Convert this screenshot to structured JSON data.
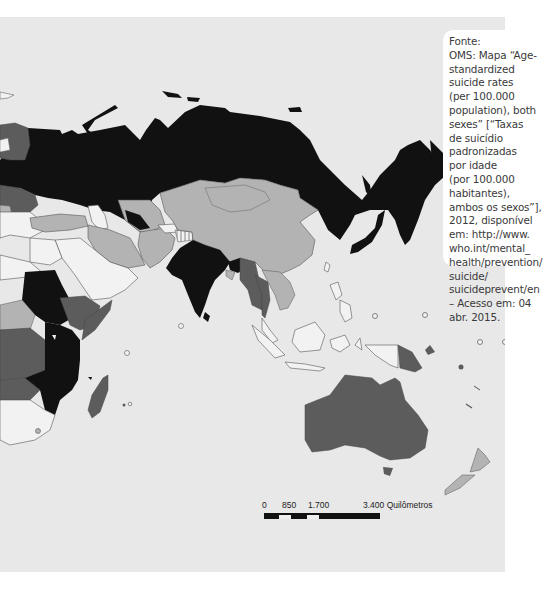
{
  "map": {
    "title": "Age-standardized suicide rates (per 100.000 population), both sexes, 2012",
    "region_shown": "Eastern Europe, Asia, East Africa, Oceania",
    "shading_colors": {
      "ocean": "#e8e8e8",
      "very_high": "#111111",
      "high": "#5c5c5c",
      "medium": "#b3b3b3",
      "low": "#f2f2f2",
      "no_data": "hatched",
      "border": "#555555"
    }
  },
  "caption": {
    "lines": [
      "Fonte:",
      "OMS: Mapa “Age-",
      "standardized",
      "suicide rates",
      "(per 100.000",
      "population), both",
      "sexes” [“Taxas",
      "de suicídio",
      "padronizadas",
      "por idade",
      "(por 100.000",
      "habitantes),",
      "ambos os sexos”],",
      "2012, disponível",
      "em: http://www.",
      "who.int/mental_",
      "health/prevention/",
      "suicide/",
      "suicideprevent/en",
      "– Acesso em: 04",
      "abr. 2015."
    ]
  },
  "scale": {
    "labels": [
      "0",
      "850",
      "1.700",
      "3.400 Quilômetros"
    ]
  }
}
